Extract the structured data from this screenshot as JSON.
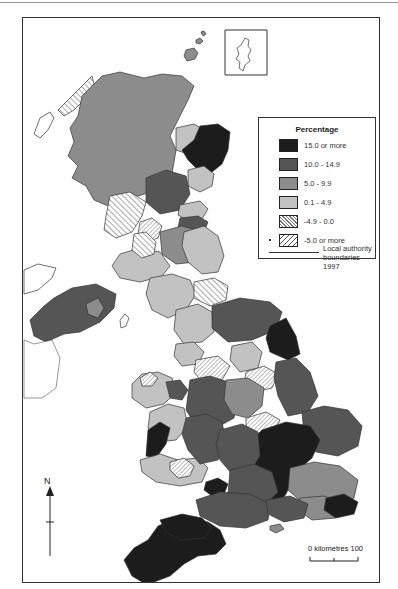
{
  "legend": {
    "title": "Percentage",
    "items": [
      {
        "label": "15.0 or more",
        "color": "#1c1c1c",
        "pattern": "solid"
      },
      {
        "label": "10.0 - 14.9",
        "color": "#555555",
        "pattern": "solid"
      },
      {
        "label": "5.0 - 9.9",
        "color": "#8c8c8c",
        "pattern": "solid"
      },
      {
        "label": "0.1 - 4.9",
        "color": "#c2c2c2",
        "pattern": "solid"
      },
      {
        "label": "-4.9 - 0.0",
        "color": "#777777",
        "pattern": "fine-hatch"
      },
      {
        "label": "-5.0 or more",
        "color": "#555555",
        "pattern": "wide-hatch"
      }
    ],
    "boundary_label_line1": "Local authority",
    "boundary_label_line2": "boundaries 1997"
  },
  "north_arrow": {
    "label": "N"
  },
  "scale_bar": {
    "label": "0  kilometres  100"
  },
  "inset": {
    "name": "Shetland"
  }
}
